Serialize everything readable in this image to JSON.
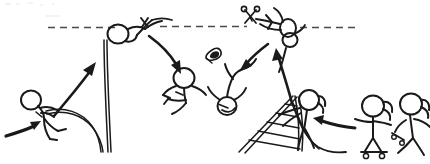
{
  "scene": {
    "title": "Stick Figure Pole Vault Sequence",
    "width": 430,
    "height": 164,
    "background_color": "#ffffff",
    "ink_color": "#1a1a1a",
    "bar_color": "#4a4a4a",
    "style": "hand-drawn stick figure line art",
    "caption": ""
  },
  "crossbar": {
    "label": "crossbar",
    "kind": "dashed-horizontal-line",
    "y": 27,
    "x_start": 48,
    "x_end": 356,
    "dash_pattern": "7 5",
    "color": "#4a4a4a"
  },
  "figures": [
    {
      "id": "runner",
      "label": "running vaulter with pole",
      "pose": "running-planting-pole",
      "x": 30,
      "y": 108,
      "has_ponytail": false
    },
    {
      "id": "vaulter-at-bar",
      "label": "vaulter clearing the crossbar",
      "pose": "inverted-over-bar",
      "x": 118,
      "y": 32,
      "has_ponytail": false
    },
    {
      "id": "faller-left",
      "label": "falling figure, arms out",
      "pose": "falling-arms-out",
      "x": 182,
      "y": 80,
      "has_ponytail": false
    },
    {
      "id": "faller-right",
      "label": "falling figure, upside down",
      "pose": "falling-head-down",
      "x": 228,
      "y": 90,
      "has_ponytail": false
    },
    {
      "id": "vaulter-cutting-bar",
      "label": "figure at bar holding scissors",
      "pose": "reaching-with-scissors",
      "x": 283,
      "y": 30,
      "has_ponytail": false
    },
    {
      "id": "ladder-climber",
      "label": "ponytailed figure on collapsing ladder",
      "pose": "standing-on-ladder",
      "x": 305,
      "y": 100,
      "has_ponytail": true
    },
    {
      "id": "observer-skateboard",
      "label": "ponytailed figure on skateboard",
      "pose": "standing-on-skateboard",
      "x": 375,
      "y": 110,
      "has_ponytail": true
    },
    {
      "id": "observer-right",
      "label": "ponytailed figure holding skateboard",
      "pose": "standing-holding-board",
      "x": 410,
      "y": 110,
      "has_ponytail": true
    }
  ],
  "props": [
    {
      "id": "vault-pole",
      "label": "bending vault pole",
      "kind": "pole",
      "x": 100,
      "y": 140
    },
    {
      "id": "scissors",
      "label": "scissors",
      "kind": "scissors",
      "x": 250,
      "y": 18
    },
    {
      "id": "flying-shoe",
      "label": "flying shoe",
      "kind": "shoe",
      "x": 214,
      "y": 58
    },
    {
      "id": "a-frame-ladder",
      "label": "collapsing A-frame ladder",
      "kind": "ladder",
      "x": 265,
      "y": 130
    },
    {
      "id": "skateboard-left",
      "label": "skateboard under figure",
      "kind": "skateboard",
      "x": 378,
      "y": 148
    },
    {
      "id": "skateboard-right",
      "label": "skateboard held by figure",
      "kind": "skateboard",
      "x": 402,
      "y": 137
    }
  ],
  "arrows": [
    {
      "id": "arrow-approach",
      "label": "arrow pointing to runner feet",
      "from": [
        8,
        133
      ],
      "to": [
        42,
        122
      ],
      "direction": "right"
    },
    {
      "id": "arrow-launch",
      "label": "arrow from runner up to bar",
      "from": [
        52,
        110
      ],
      "to": [
        98,
        52
      ],
      "direction": "up-right"
    },
    {
      "id": "arrow-fall-left",
      "label": "arrow from bar down to falling figure",
      "from": [
        150,
        40
      ],
      "to": [
        178,
        72
      ],
      "direction": "down-right"
    },
    {
      "id": "arrow-fall-right",
      "label": "arrow down to upside-down faller",
      "from": [
        265,
        42
      ],
      "to": [
        240,
        68
      ],
      "direction": "down-left"
    },
    {
      "id": "arrow-climb",
      "label": "arrow from ladder up to bar figure",
      "from": [
        290,
        100
      ],
      "to": [
        275,
        50
      ],
      "direction": "up"
    },
    {
      "id": "arrow-approach-ladder",
      "label": "arrow from observers to ladder",
      "from": [
        352,
        126
      ],
      "to": [
        312,
        120
      ],
      "direction": "left"
    }
  ]
}
